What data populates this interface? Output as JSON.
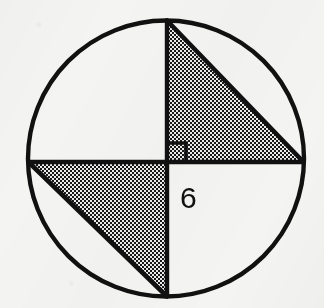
{
  "figure": {
    "type": "geometry-diagram",
    "background_color": "#f4f4f2",
    "stroke_color": "#111111",
    "shade_color": "#8c8c8c",
    "canvas": {
      "width": 324,
      "height": 308
    }
  },
  "circle": {
    "name": "circle-outline",
    "center_x": 166,
    "center_y": 158.5,
    "radius": 138,
    "stroke_width": 4.4,
    "fill": "none"
  },
  "points": {
    "top": {
      "label": "top-vertex",
      "x": 167,
      "y": 20.5
    },
    "bottom": {
      "label": "bottom-vertex",
      "x": 167,
      "y": 296.5
    },
    "left": {
      "label": "left-vertex",
      "x": 28.5,
      "y": 162
    },
    "right": {
      "label": "right-vertex",
      "x": 303.5,
      "y": 162
    },
    "center": {
      "label": "center-point",
      "x": 167,
      "y": 162
    }
  },
  "segments": [
    {
      "name": "vertical-diameter",
      "x1": 167,
      "y1": 20.5,
      "x2": 167,
      "y2": 296.5,
      "stroke_width": 4.4
    },
    {
      "name": "horizontal-chord",
      "x1": 28.5,
      "y1": 162,
      "x2": 303.5,
      "y2": 162,
      "stroke_width": 4.4
    },
    {
      "name": "upper-right-hypotenuse",
      "x1": 167,
      "y1": 20.5,
      "x2": 303.5,
      "y2": 162,
      "stroke_width": 4.6
    },
    {
      "name": "lower-left-hypotenuse",
      "x1": 28.5,
      "y1": 162,
      "x2": 167,
      "y2": 296.5,
      "stroke_width": 4.6
    }
  ],
  "triangles": [
    {
      "name": "upper-right-shaded-triangle",
      "points": "167,20.5 167,162 303.5,162",
      "shaded": true,
      "position": "upper-right"
    },
    {
      "name": "lower-left-shaded-triangle",
      "points": "28.5,162 167,162 167,296.5",
      "shaded": true,
      "position": "lower-left"
    }
  ],
  "right_angle_marker": {
    "name": "right-angle-marker",
    "corner_x": 167,
    "corner_y": 162,
    "size": 19,
    "points": "167,143 186,143 186,162",
    "stroke_width": 3.6,
    "description": "square marker indicating 90 degrees at center"
  },
  "labels": [
    {
      "name": "side-length-label",
      "text": "6",
      "x": 180,
      "y": 208,
      "font_size": 30,
      "describes": "length of lower half of vertical diameter"
    }
  ]
}
